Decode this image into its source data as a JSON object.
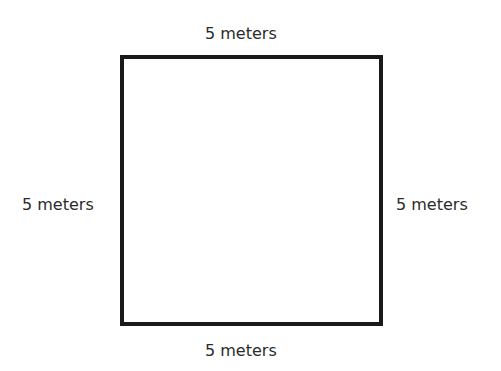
{
  "figure": {
    "shape": "square",
    "labels": {
      "top": "5 meters",
      "bottom": "5 meters",
      "left": "5 meters",
      "right": "5 meters"
    },
    "colors": {
      "stroke": "#1a1a1a",
      "text": "#2b2b2b",
      "background": "#ffffff"
    }
  }
}
